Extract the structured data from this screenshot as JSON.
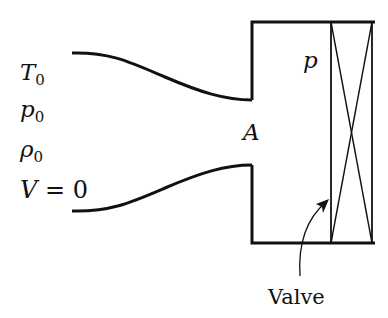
{
  "diagram": {
    "reservoir_labels": [
      {
        "sym": "T",
        "sub": "0"
      },
      {
        "sym": "p",
        "sub": "0"
      },
      {
        "sym": "ρ",
        "sub": "0"
      },
      {
        "text": "V = 0",
        "sym": "V",
        "rest": " = 0"
      }
    ],
    "throat_label": "A",
    "tank_label": "p",
    "valve_label": "Valve",
    "stroke_color": "#111111"
  }
}
